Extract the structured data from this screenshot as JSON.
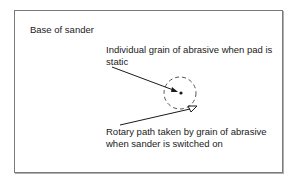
{
  "diagram": {
    "title_label": "Base of sander",
    "static_label_line1": "Individual grain of abrasive when pad is",
    "static_label_line2": "static",
    "rotary_label_line1": "Rotary path taken by grain of abrasive",
    "rotary_label_line2": "when sander is switched on",
    "colors": {
      "line": "#1a1a1a",
      "frame": "#7a7a7a",
      "dashed_circle": "#555555"
    }
  }
}
